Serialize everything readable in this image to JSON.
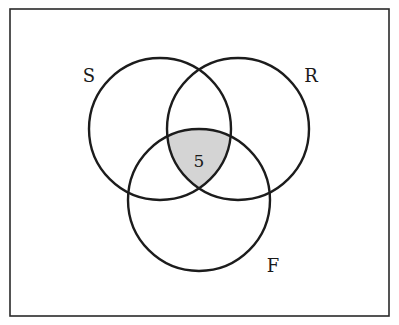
{
  "diagram": {
    "type": "venn",
    "frame": {
      "x": 10,
      "y": 9,
      "width": 379,
      "height": 307,
      "stroke": "#2a2a2a"
    },
    "sets": [
      {
        "name": "S",
        "label": "S",
        "cx": 160,
        "cy": 129,
        "r": 71,
        "label_x": 89,
        "label_y": 82
      },
      {
        "name": "R",
        "label": "R",
        "cx": 238,
        "cy": 129,
        "r": 71,
        "label_x": 311,
        "label_y": 82
      },
      {
        "name": "F",
        "label": "F",
        "cx": 199,
        "cy": 200,
        "r": 71,
        "label_x": 273,
        "label_y": 272
      }
    ],
    "regions": [
      {
        "name": "S∩R∩F",
        "value": "5",
        "shaded": true,
        "fill": "#d4d4d4"
      }
    ],
    "stroke_color": "#1c1c1c"
  }
}
